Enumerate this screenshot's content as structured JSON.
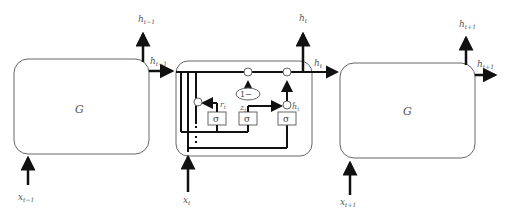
{
  "diagram": {
    "type": "GRU recurrent network unrolled",
    "left_cell": {
      "label": "G",
      "input": "x",
      "input_sub": "t−1",
      "output_up": "h",
      "output_up_sub": "t−1",
      "output_right": "h",
      "output_right_sub": "t−1"
    },
    "middle_cell": {
      "input": "x",
      "input_sub": "t",
      "output_up": "h",
      "output_up_sub": "t",
      "output_right": "h",
      "output_right_sub": "t",
      "gates": [
        {
          "name": "reset",
          "symbol": "σ",
          "label": "r",
          "label_sub": "t"
        },
        {
          "name": "update",
          "symbol": "σ",
          "label": "z",
          "label_sub": "t"
        },
        {
          "name": "candidate",
          "symbol": "σ",
          "label": "h̃",
          "label_sub": "t"
        }
      ],
      "one_minus": "1−",
      "ops": {
        "multiply": "⊗",
        "add": "⊕"
      }
    },
    "right_cell": {
      "label": "G",
      "input": "x",
      "input_sub": "t+1",
      "output_up": "h",
      "output_up_sub": "t+1",
      "output_right": "h",
      "output_right_sub": "t+1"
    }
  }
}
